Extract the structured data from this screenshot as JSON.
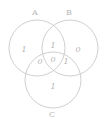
{
  "diagram": {
    "type": "venn-3-set",
    "stroke_color": "#c9c9c9",
    "text_color": "#b4b4b4",
    "background_color": "#ffffff",
    "sets": [
      {
        "id": "A",
        "label": "A",
        "position": "top-left"
      },
      {
        "id": "B",
        "label": "B",
        "position": "top-right"
      },
      {
        "id": "C",
        "label": "C",
        "position": "bottom"
      }
    ],
    "regions": [
      {
        "id": "a-only",
        "name": "A only",
        "value": "1"
      },
      {
        "id": "b-only",
        "name": "B only",
        "value": "0"
      },
      {
        "id": "a-and-b",
        "name": "A and B",
        "value": "1"
      },
      {
        "id": "a-and-c",
        "name": "A and C",
        "value": "0"
      },
      {
        "id": "a-b-c",
        "name": "A and B and C",
        "value": "0"
      },
      {
        "id": "b-and-c",
        "name": "B and C",
        "value": "1"
      },
      {
        "id": "c-only",
        "name": "C only",
        "value": "1"
      }
    ]
  }
}
